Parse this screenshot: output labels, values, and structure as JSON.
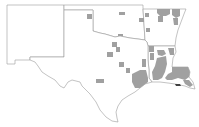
{
  "map": {
    "title": "",
    "region": "South Central United States",
    "states": [
      "New Mexico",
      "Texas",
      "Oklahoma",
      "Arkansas",
      "Louisiana"
    ],
    "colors": {
      "background": "#ffffff",
      "state_outline": "#9a9a9a",
      "highlighted_county": "#a0a0a0",
      "water_feature": "#404040"
    },
    "legend": []
  }
}
